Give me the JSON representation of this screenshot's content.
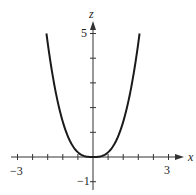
{
  "chart_data": {
    "type": "line",
    "title": "",
    "xlabel": "x",
    "ylabel": "z",
    "xlim": [
      -3,
      3
    ],
    "ylim": [
      -1,
      5
    ],
    "x_tick_labels": [
      "-3",
      "3"
    ],
    "y_tick_labels": [
      "5",
      "-1"
    ],
    "x_tick_count_each_side": 5,
    "y_ticks": [
      -1,
      1,
      2,
      3,
      4,
      5
    ],
    "grid": false,
    "legend": null,
    "series": [
      {
        "name": "curve",
        "description": "even, U-shaped curve with flat minimum at the origin",
        "x": [
          -1.85,
          -1.5,
          -1.03,
          -0.63,
          0,
          0.63,
          1.03,
          1.5,
          1.85
        ],
        "y": [
          5,
          2.31,
          1,
          0.28,
          0,
          0.28,
          1,
          2.31,
          5
        ]
      }
    ]
  },
  "labels": {
    "x_axis": "x",
    "z_axis": "z",
    "x_min": "−3",
    "x_max": "3",
    "z_top": "5",
    "z_bottom": "−1"
  }
}
